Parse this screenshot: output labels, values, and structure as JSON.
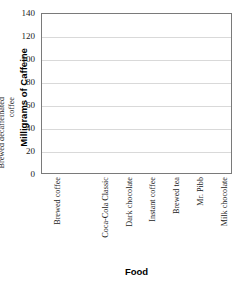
{
  "chart_data": {
    "type": "bar",
    "title": "",
    "xlabel": "Food",
    "ylabel": "Milligrams of Caffeine",
    "categories": [
      "Brewed coffee",
      "Brewed decaffeinated coffee",
      "Coca-Cola Classic",
      "Dark chocolate",
      "Instant coffee",
      "Brewed tea",
      "Mr. Pibb",
      "Milk chocolate"
    ],
    "values": [
      0,
      0,
      0,
      0,
      0,
      0,
      0,
      0
    ],
    "ylim": [
      0,
      140
    ],
    "ytick_labels": [
      "0",
      "20",
      "40",
      "60",
      "80",
      "100",
      "120",
      "140"
    ],
    "ytick_values": [
      0,
      20,
      40,
      60,
      80,
      100,
      120,
      140
    ],
    "grid": "horizontal",
    "legend": "none",
    "colors": {
      "frame": "#7a7a7a",
      "gridline": "#d9d9d9",
      "text": "#1a1a1a",
      "background": "#ffffff"
    }
  }
}
